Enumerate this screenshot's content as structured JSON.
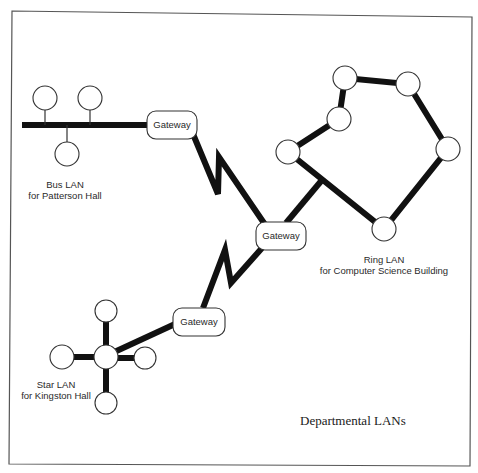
{
  "diagram": {
    "title": "Departmental LANs",
    "networks": [
      {
        "id": "bus",
        "type": "Bus LAN",
        "label_line1": "Bus LAN",
        "label_line2": "for Patterson Hall",
        "node_count": 3
      },
      {
        "id": "ring",
        "type": "Ring LAN",
        "label_line1": "Ring LAN",
        "label_line2": "for Computer Science Building",
        "node_count": 6
      },
      {
        "id": "star",
        "type": "Star LAN",
        "label_line1": "Star LAN",
        "label_line2": "for Kingston Hall",
        "node_count": 5
      }
    ],
    "gateways": [
      {
        "id": "gw-bus",
        "label": "Gateway"
      },
      {
        "id": "gw-center",
        "label": "Gateway"
      },
      {
        "id": "gw-star",
        "label": "Gateway"
      }
    ],
    "connections": [
      {
        "from": "gw-bus",
        "to": "gw-center",
        "style": "zigzag"
      },
      {
        "from": "gw-center",
        "to": "gw-star",
        "style": "zigzag"
      },
      {
        "from": "gw-center",
        "to": "ring",
        "style": "straight"
      },
      {
        "from": "gw-star",
        "to": "star",
        "style": "straight"
      }
    ]
  }
}
